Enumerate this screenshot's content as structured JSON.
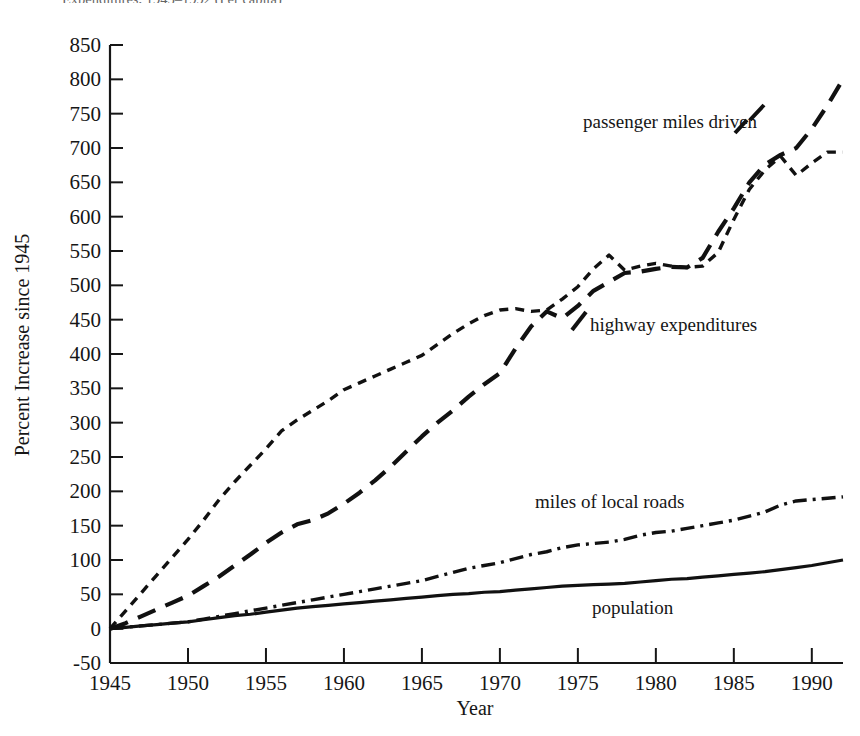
{
  "caption_partial": "Expenditures, 1945–1992   (Per capita)",
  "chart_data": {
    "type": "line",
    "title": "",
    "xlabel": "Year",
    "ylabel": "Percent Increase since 1945",
    "xlim": [
      1945,
      1992
    ],
    "ylim": [
      -50,
      850
    ],
    "grid": false,
    "legend": "inline-labels",
    "xticks": [
      1945,
      1950,
      1955,
      1960,
      1965,
      1970,
      1975,
      1980,
      1985,
      1990
    ],
    "yticks": [
      -50,
      0,
      50,
      100,
      150,
      200,
      250,
      300,
      350,
      400,
      450,
      500,
      550,
      600,
      650,
      700,
      750,
      800,
      850
    ],
    "x": [
      1945,
      1946,
      1947,
      1948,
      1949,
      1950,
      1951,
      1952,
      1953,
      1954,
      1955,
      1956,
      1957,
      1958,
      1959,
      1960,
      1961,
      1962,
      1963,
      1964,
      1965,
      1966,
      1967,
      1968,
      1969,
      1970,
      1971,
      1972,
      1973,
      1974,
      1975,
      1976,
      1977,
      1978,
      1979,
      1980,
      1981,
      1982,
      1983,
      1984,
      1985,
      1986,
      1987,
      1988,
      1989,
      1990,
      1991,
      1992
    ],
    "series": [
      {
        "name": "passenger miles driven",
        "label": "passenger miles driven",
        "style": "long-dash",
        "color": "#111111",
        "values": [
          0,
          8,
          18,
          28,
          38,
          48,
          62,
          76,
          92,
          108,
          125,
          140,
          152,
          158,
          168,
          182,
          198,
          216,
          236,
          258,
          280,
          300,
          318,
          338,
          356,
          372,
          408,
          440,
          462,
          452,
          470,
          492,
          505,
          518,
          520,
          524,
          527,
          526,
          540,
          578,
          612,
          650,
          676,
          690,
          700,
          728,
          762,
          800
        ]
      },
      {
        "name": "highway expenditures",
        "label": "highway expenditures",
        "style": "short-dash",
        "color": "#111111",
        "values": [
          0,
          26,
          52,
          78,
          104,
          130,
          158,
          188,
          214,
          238,
          262,
          288,
          304,
          318,
          332,
          348,
          358,
          368,
          378,
          388,
          398,
          414,
          430,
          444,
          456,
          464,
          466,
          462,
          464,
          480,
          498,
          524,
          544,
          522,
          528,
          532,
          528,
          526,
          528,
          548,
          596,
          640,
          668,
          688,
          660,
          678,
          694,
          694
        ]
      },
      {
        "name": "miles of local roads",
        "label": "miles of local roads",
        "style": "dash-dot",
        "color": "#111111",
        "values": [
          0,
          2,
          4,
          6,
          8,
          10,
          14,
          18,
          22,
          26,
          30,
          34,
          38,
          42,
          46,
          50,
          54,
          58,
          62,
          66,
          70,
          76,
          82,
          88,
          92,
          96,
          102,
          108,
          112,
          118,
          122,
          124,
          126,
          130,
          136,
          140,
          142,
          146,
          150,
          154,
          158,
          164,
          170,
          180,
          186,
          188,
          190,
          192
        ]
      },
      {
        "name": "population",
        "label": "population",
        "style": "solid",
        "color": "#111111",
        "values": [
          0,
          2,
          4,
          6,
          8,
          10,
          13,
          16,
          19,
          21,
          24,
          27,
          30,
          32,
          34,
          36,
          38,
          40,
          42,
          44,
          46,
          48,
          50,
          51,
          53,
          54,
          56,
          58,
          60,
          62,
          63,
          64,
          65,
          66,
          68,
          70,
          72,
          73,
          75,
          77,
          79,
          81,
          83,
          86,
          89,
          92,
          96,
          100
        ]
      }
    ]
  }
}
